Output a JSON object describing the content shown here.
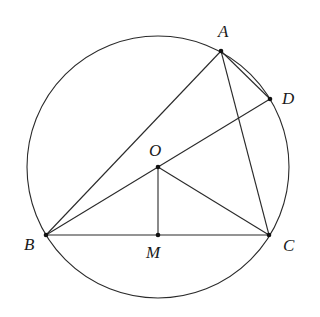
{
  "figure": {
    "type": "geometry",
    "circle": {
      "center": "O",
      "cx": 158,
      "cy": 167,
      "r": 131
    },
    "points": {
      "A": {
        "label": "A",
        "x": 221,
        "y": 51,
        "lx": 218,
        "ly": 37
      },
      "D": {
        "label": "D",
        "x": 270,
        "y": 99,
        "lx": 282,
        "ly": 104
      },
      "O": {
        "label": "O",
        "x": 158,
        "y": 167,
        "lx": 149,
        "ly": 156
      },
      "B": {
        "label": "B",
        "x": 46,
        "y": 235,
        "lx": 24,
        "ly": 249
      },
      "M": {
        "label": "M",
        "x": 158,
        "y": 235,
        "lx": 146,
        "ly": 258
      },
      "C": {
        "label": "C",
        "x": 269,
        "y": 235,
        "lx": 283,
        "ly": 250
      }
    },
    "segments": [
      [
        "A",
        "B"
      ],
      [
        "A",
        "C"
      ],
      [
        "A",
        "D"
      ],
      [
        "B",
        "D"
      ],
      [
        "B",
        "C"
      ],
      [
        "O",
        "M"
      ],
      [
        "O",
        "C"
      ]
    ]
  }
}
